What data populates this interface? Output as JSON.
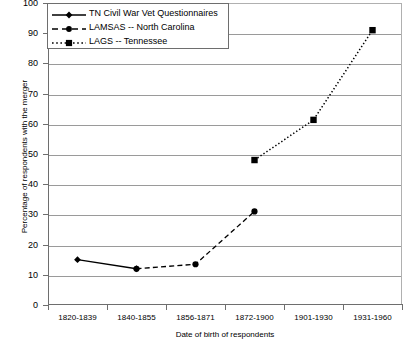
{
  "chart_data": {
    "type": "line",
    "title": "",
    "xlabel": "Date of birth of respondents",
    "ylabel": "Percentage of respondents with the merger",
    "categories": [
      "1820-1839",
      "1840-1855",
      "1856-1871",
      "1872-1900",
      "1901-1930",
      "1931-1960"
    ],
    "ylim": [
      0,
      100
    ],
    "yticks": [
      0,
      10,
      20,
      30,
      40,
      50,
      60,
      70,
      80,
      90,
      100
    ],
    "ytick_labels": [
      "0",
      "10",
      "20",
      "30",
      "40",
      "50",
      "60",
      "70",
      "80",
      "90",
      "100"
    ],
    "grid": true,
    "grid_axis": "y",
    "legend_position": "upper left",
    "series": [
      {
        "name": "TN Civil War Vet Questionnaires",
        "marker": "diamond",
        "linestyle": "solid",
        "color": "#000000",
        "x": [
          "1820-1839",
          "1840-1855"
        ],
        "values": [
          15,
          12
        ]
      },
      {
        "name": "LAMSAS -- North Carolina",
        "marker": "circle",
        "linestyle": "dashed",
        "color": "#000000",
        "x": [
          "1840-1855",
          "1856-1871",
          "1872-1900"
        ],
        "values": [
          12,
          13.5,
          31
        ]
      },
      {
        "name": "LAGS -- Tennessee",
        "marker": "square",
        "linestyle": "dotted",
        "color": "#000000",
        "x": [
          "1872-1900",
          "1901-1930",
          "1931-1960"
        ],
        "values": [
          48,
          61.3,
          91
        ]
      }
    ]
  },
  "legend": {
    "entries": [
      "TN Civil War Vet Questionnaires",
      "LAMSAS -- North Carolina",
      "LAGS -- Tennessee"
    ]
  }
}
